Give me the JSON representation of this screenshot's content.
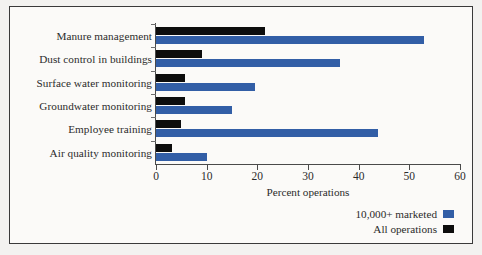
{
  "chart_data": {
    "type": "bar",
    "orientation": "horizontal",
    "title": "",
    "xlabel": "Percent operations",
    "ylabel": "",
    "xlim": [
      0,
      60
    ],
    "xticks": [
      0,
      10,
      20,
      30,
      40,
      50,
      60
    ],
    "grid": false,
    "legend_position": "bottom-right",
    "categories": [
      "Manure management",
      "Dust control in buildings",
      "Surface water monitoring",
      "Groundwater monitoring",
      "Employee training",
      "Air quality monitoring"
    ],
    "series": [
      {
        "name": "10,000+ marketed",
        "color": "#325ea6",
        "values": [
          52.9,
          36.3,
          19.5,
          15.0,
          43.8,
          10.0
        ]
      },
      {
        "name": "All operations",
        "color": "#0d0d0d",
        "values": [
          21.5,
          9.0,
          5.7,
          5.7,
          5.0,
          3.2
        ]
      }
    ]
  },
  "legend": {
    "entries": [
      {
        "label": "10,000+ marketed",
        "color": "#325ea6"
      },
      {
        "label": "All operations",
        "color": "#0d0d0d"
      }
    ]
  }
}
